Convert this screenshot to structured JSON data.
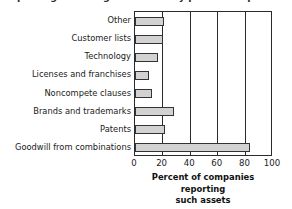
{
  "clipped_title": "Reporting of intangible assets by public companies",
  "chart_data": {
    "type": "bar",
    "orientation": "horizontal",
    "title": "",
    "categories": [
      "Other",
      "Customer lists",
      "Technology",
      "Licenses and franchises",
      "Noncompete clauses",
      "Brands and trademarks",
      "Patents",
      "Goodwill from combinations"
    ],
    "values": [
      21,
      20,
      17,
      10,
      12,
      28,
      22,
      83
    ],
    "xlabel_lines": [
      "Percent of companies reporting",
      "such assets"
    ],
    "xlabel": "Percent of companies reporting such assets",
    "ylabel": "",
    "xlim": [
      0,
      100
    ],
    "xticks": [
      0,
      20,
      40,
      60,
      80,
      100
    ],
    "xtick_labels": [
      "0",
      "20",
      "40",
      "60",
      "80",
      "100"
    ],
    "grid": "vertical-major",
    "legend": "none",
    "bar_fill": "#d2d2d2",
    "bar_edge": "#333333",
    "axis_color": "#2b2b2b"
  }
}
